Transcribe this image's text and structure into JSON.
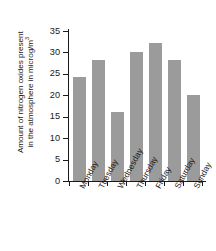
{
  "chart_data": {
    "type": "bar",
    "title": "",
    "subtitle": "",
    "xlabel": "",
    "ylabel": "Amount of nitrogen oxides present in the atmosphere in microg/m³",
    "ylabel_line1": "Amount of nitrogen oxides present",
    "ylabel_line2_pre": "in the atmosphere in microg/m",
    "ylabel_line2_sup": "3",
    "categories": [
      "Monday",
      "Tuesday",
      "Wednesday",
      "Thursday",
      "Friday",
      "Saturday",
      "Sunday"
    ],
    "values": [
      24.2,
      28.2,
      16.2,
      30.0,
      32.2,
      28.2,
      20.0
    ],
    "series": [
      {
        "name": "Nitrogen oxides",
        "values": [
          24.2,
          28.2,
          16.2,
          30.0,
          32.2,
          28.2,
          20.0
        ]
      }
    ],
    "ylim": [
      0,
      35
    ],
    "yticks": [
      0,
      5,
      10,
      15,
      20,
      25,
      30,
      35
    ],
    "ytick_labels": [
      "0",
      "5",
      "10",
      "15",
      "20",
      "25",
      "30",
      "35"
    ],
    "grid": false,
    "legend": false,
    "legend_position": "none",
    "bar_color": "#9b9b9b",
    "axis_color": "#1a1a1a",
    "background_color": "#ffffff"
  }
}
